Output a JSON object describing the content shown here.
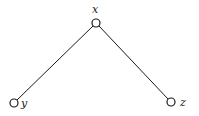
{
  "diagram": {
    "type": "tree",
    "nodes": [
      {
        "id": "x",
        "label": "x",
        "cx": 96,
        "cy": 23,
        "r": 4,
        "label_x": 92,
        "label_y": 13
      },
      {
        "id": "y",
        "label": "y",
        "cx": 14,
        "cy": 103,
        "r": 4,
        "label_x": 22,
        "label_y": 107
      },
      {
        "id": "z",
        "label": "z",
        "cx": 171,
        "cy": 102,
        "r": 4,
        "label_x": 180,
        "label_y": 106
      }
    ],
    "edges": [
      {
        "from": "x",
        "to": "y"
      },
      {
        "from": "x",
        "to": "z"
      }
    ],
    "colors": {
      "stroke": "#1a1a1a",
      "background": "#ffffff"
    }
  }
}
